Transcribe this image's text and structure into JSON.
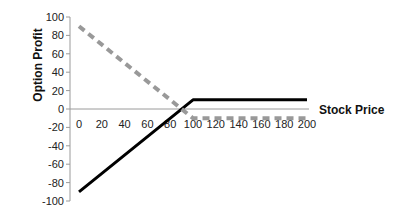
{
  "chart_data": {
    "type": "line",
    "title": "",
    "xlabel": "Stock Price",
    "ylabel": "Option Profit",
    "xlim": [
      0,
      200
    ],
    "ylim": [
      -100,
      100
    ],
    "x_ticks": [
      "0",
      "20",
      "40",
      "60",
      "80",
      "100",
      "120",
      "140",
      "160",
      "180",
      "200"
    ],
    "y_ticks": [
      "100",
      "80",
      "60",
      "40",
      "20",
      "0",
      "-20",
      "-40",
      "-60",
      "-80",
      "-100"
    ],
    "grid": false,
    "legend": null,
    "series": [
      {
        "name": "Long call profit",
        "style": "solid",
        "color": "#000000",
        "x": [
          0,
          100,
          200
        ],
        "y": [
          -90,
          10,
          10
        ]
      },
      {
        "name": "Short position profit",
        "style": "dashed",
        "color": "#999999",
        "x": [
          0,
          90,
          100,
          200
        ],
        "y": [
          90,
          0,
          -10,
          -10
        ]
      }
    ]
  }
}
